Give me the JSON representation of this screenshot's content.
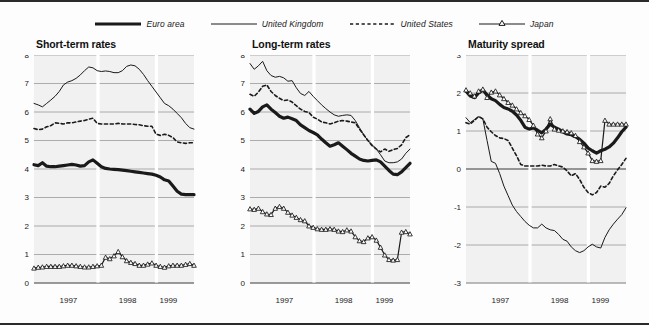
{
  "legend": {
    "items": [
      {
        "label": "Euro area",
        "style": "thick-solid",
        "icon": "line-swatch-icon",
        "color": "#1a1a1a",
        "width": 3.2,
        "dash": "none",
        "marker": "none"
      },
      {
        "label": "United Kingdom",
        "style": "thin-solid",
        "icon": "line-swatch-icon",
        "color": "#1a1a1a",
        "width": 1.0,
        "dash": "none",
        "marker": "none"
      },
      {
        "label": "United States",
        "style": "dashed",
        "icon": "dashed-swatch-icon",
        "color": "#1a1a1a",
        "width": 1.6,
        "dash": "3.2,2.6",
        "marker": "none"
      },
      {
        "label": "Japan",
        "style": "marker-solid",
        "icon": "marker-swatch-icon",
        "color": "#1a1a1a",
        "width": 1.2,
        "dash": "none",
        "marker": "triangle"
      }
    ]
  },
  "axis": {
    "x_tick_labels": [
      "1997",
      "1998",
      "1999"
    ],
    "x_tick_positions": [
      0.215,
      0.585,
      0.84
    ],
    "year_band_positions": [
      0.4,
      0.765
    ],
    "xlabel": "",
    "grid": true
  },
  "chart_data": [
    {
      "type": "line",
      "title": "Short-term rates",
      "xlabel": "",
      "ylabel": "",
      "ylim": [
        0,
        8
      ],
      "yticks": [
        0,
        1,
        2,
        3,
        4,
        5,
        6,
        7,
        8
      ],
      "ytick_labels": [
        "0",
        "1",
        "2",
        "3",
        "4",
        "5",
        "6",
        "7",
        "8"
      ],
      "x": [
        0,
        1,
        2,
        3,
        4,
        5,
        6,
        7,
        8,
        9,
        10,
        11,
        12,
        13,
        14,
        15,
        16,
        17,
        18,
        19,
        20,
        21,
        22,
        23,
        24,
        25,
        26,
        27,
        28,
        29,
        30,
        31,
        32,
        33,
        34,
        35,
        36,
        37,
        38
      ],
      "series": [
        {
          "name": "Euro area",
          "values": [
            4.15,
            4.12,
            4.22,
            4.1,
            4.08,
            4.08,
            4.1,
            4.12,
            4.14,
            4.16,
            4.14,
            4.1,
            4.12,
            4.25,
            4.32,
            4.2,
            4.08,
            4.02,
            4.0,
            3.99,
            3.98,
            3.96,
            3.94,
            3.92,
            3.9,
            3.88,
            3.86,
            3.84,
            3.82,
            3.78,
            3.72,
            3.62,
            3.58,
            3.4,
            3.22,
            3.12,
            3.1,
            3.1,
            3.1
          ]
        },
        {
          "name": "United Kingdom",
          "values": [
            6.3,
            6.25,
            6.18,
            6.3,
            6.42,
            6.55,
            6.72,
            6.95,
            7.05,
            7.1,
            7.18,
            7.3,
            7.45,
            7.58,
            7.55,
            7.45,
            7.42,
            7.44,
            7.42,
            7.38,
            7.38,
            7.45,
            7.6,
            7.65,
            7.62,
            7.5,
            7.32,
            7.1,
            6.9,
            6.7,
            6.5,
            6.3,
            6.22,
            6.1,
            5.95,
            5.8,
            5.6,
            5.45,
            5.4
          ]
        },
        {
          "name": "United States",
          "values": [
            5.42,
            5.38,
            5.4,
            5.48,
            5.52,
            5.62,
            5.6,
            5.58,
            5.62,
            5.62,
            5.65,
            5.68,
            5.7,
            5.75,
            5.78,
            5.6,
            5.58,
            5.58,
            5.58,
            5.58,
            5.6,
            5.58,
            5.58,
            5.58,
            5.56,
            5.55,
            5.52,
            5.5,
            5.5,
            5.22,
            5.18,
            5.22,
            5.18,
            5.1,
            4.95,
            4.92,
            4.9,
            4.92,
            4.92
          ]
        },
        {
          "name": "Japan",
          "values": [
            0.52,
            0.55,
            0.56,
            0.58,
            0.58,
            0.58,
            0.58,
            0.6,
            0.62,
            0.62,
            0.6,
            0.58,
            0.56,
            0.56,
            0.58,
            0.6,
            0.62,
            0.9,
            0.85,
            0.95,
            1.1,
            0.92,
            0.78,
            0.72,
            0.68,
            0.62,
            0.62,
            0.66,
            0.7,
            0.62,
            0.58,
            0.55,
            0.6,
            0.62,
            0.62,
            0.62,
            0.65,
            0.68,
            0.62
          ]
        }
      ]
    },
    {
      "type": "line",
      "title": "Long-term rates",
      "xlabel": "",
      "ylabel": "",
      "ylim": [
        0,
        8
      ],
      "yticks": [
        0,
        1,
        2,
        3,
        4,
        5,
        6,
        7,
        8
      ],
      "ytick_labels": [
        "0",
        "1",
        "2",
        "3",
        "4",
        "5",
        "6",
        "7",
        "8"
      ],
      "x": [
        0,
        1,
        2,
        3,
        4,
        5,
        6,
        7,
        8,
        9,
        10,
        11,
        12,
        13,
        14,
        15,
        16,
        17,
        18,
        19,
        20,
        21,
        22,
        23,
        24,
        25,
        26,
        27,
        28,
        29,
        30,
        31,
        32,
        33,
        34,
        35,
        36,
        37,
        38
      ],
      "series": [
        {
          "name": "Euro area",
          "values": [
            6.1,
            5.95,
            6.02,
            6.18,
            6.25,
            6.1,
            5.98,
            5.85,
            5.78,
            5.82,
            5.76,
            5.7,
            5.55,
            5.45,
            5.35,
            5.28,
            5.2,
            5.05,
            4.92,
            4.8,
            4.85,
            4.92,
            4.8,
            4.68,
            4.55,
            4.45,
            4.35,
            4.3,
            4.28,
            4.3,
            4.32,
            4.25,
            4.1,
            3.95,
            3.82,
            3.8,
            3.9,
            4.05,
            4.2
          ]
        },
        {
          "name": "United Kingdom",
          "values": [
            7.7,
            7.5,
            7.62,
            7.78,
            7.45,
            7.28,
            7.22,
            7.25,
            7.2,
            7.08,
            7.1,
            6.85,
            6.65,
            6.58,
            6.72,
            6.55,
            6.4,
            6.25,
            6.12,
            6.0,
            5.9,
            5.85,
            5.88,
            5.9,
            5.88,
            5.7,
            5.45,
            5.2,
            5.0,
            4.85,
            4.7,
            4.5,
            4.28,
            4.22,
            4.22,
            4.25,
            4.35,
            4.55,
            4.7
          ]
        },
        {
          "name": "United States",
          "values": [
            6.62,
            6.55,
            6.7,
            6.9,
            6.95,
            6.72,
            6.58,
            6.48,
            6.4,
            6.42,
            6.35,
            6.22,
            6.1,
            6.02,
            5.98,
            5.82,
            5.75,
            5.65,
            5.62,
            5.58,
            5.62,
            5.68,
            5.7,
            5.68,
            5.65,
            5.62,
            5.4,
            5.2,
            5.0,
            4.82,
            4.7,
            4.6,
            4.7,
            4.62,
            4.68,
            4.72,
            4.85,
            5.1,
            5.2
          ]
        },
        {
          "name": "Japan",
          "values": [
            2.6,
            2.58,
            2.62,
            2.5,
            2.42,
            2.4,
            2.62,
            2.68,
            2.62,
            2.48,
            2.38,
            2.3,
            2.22,
            2.18,
            2.0,
            1.95,
            1.9,
            1.88,
            1.88,
            1.9,
            1.88,
            1.82,
            1.8,
            1.86,
            1.82,
            1.62,
            1.48,
            1.45,
            1.58,
            1.62,
            1.5,
            1.25,
            0.98,
            0.82,
            0.8,
            0.82,
            1.78,
            1.8,
            1.72
          ]
        }
      ]
    },
    {
      "type": "line",
      "title": "Maturity spread",
      "xlabel": "",
      "ylabel": "",
      "ylim": [
        -3,
        3
      ],
      "yticks": [
        -3,
        -2,
        -1,
        0,
        1,
        2,
        3
      ],
      "ytick_labels": [
        "-3",
        "-2",
        "-1",
        "0",
        "1",
        "2",
        "3"
      ],
      "x": [
        0,
        1,
        2,
        3,
        4,
        5,
        6,
        7,
        8,
        9,
        10,
        11,
        12,
        13,
        14,
        15,
        16,
        17,
        18,
        19,
        20,
        21,
        22,
        23,
        24,
        25,
        26,
        27,
        28,
        29,
        30,
        31,
        32,
        33,
        34,
        35,
        36,
        37,
        38
      ],
      "series": [
        {
          "name": "Euro area",
          "values": [
            2.05,
            1.92,
            1.88,
            2.0,
            2.08,
            1.95,
            1.85,
            1.8,
            1.7,
            1.62,
            1.58,
            1.52,
            1.42,
            1.28,
            1.1,
            1.05,
            1.08,
            1.02,
            0.95,
            1.05,
            1.18,
            1.1,
            1.05,
            0.98,
            0.92,
            0.9,
            0.85,
            0.78,
            0.68,
            0.55,
            0.48,
            0.42,
            0.48,
            0.52,
            0.58,
            0.68,
            0.82,
            0.98,
            1.1
          ]
        },
        {
          "name": "United Kingdom",
          "values": [
            1.35,
            1.22,
            1.3,
            1.38,
            1.32,
            0.75,
            0.2,
            0.15,
            -0.12,
            -0.45,
            -0.7,
            -0.95,
            -1.12,
            -1.25,
            -1.38,
            -1.48,
            -1.55,
            -1.55,
            -1.45,
            -1.55,
            -1.6,
            -1.62,
            -1.72,
            -1.85,
            -1.9,
            -2.05,
            -2.15,
            -2.2,
            -2.15,
            -2.05,
            -1.98,
            -2.05,
            -2.08,
            -1.8,
            -1.6,
            -1.45,
            -1.32,
            -1.2,
            -1.02
          ]
        },
        {
          "name": "United States",
          "values": [
            1.22,
            1.18,
            1.28,
            1.38,
            1.32,
            1.1,
            0.98,
            0.88,
            0.82,
            0.8,
            0.75,
            0.55,
            0.35,
            0.12,
            0.08,
            0.08,
            0.08,
            0.08,
            0.1,
            0.08,
            0.08,
            0.12,
            0.08,
            0.05,
            -0.05,
            -0.18,
            -0.12,
            -0.28,
            -0.48,
            -0.62,
            -0.68,
            -0.62,
            -0.45,
            -0.48,
            -0.38,
            -0.18,
            -0.02,
            0.12,
            0.28
          ]
        },
        {
          "name": "Japan",
          "values": [
            2.08,
            2.0,
            1.92,
            2.05,
            2.1,
            1.88,
            2.02,
            2.05,
            1.95,
            1.85,
            1.75,
            1.68,
            1.58,
            1.48,
            1.4,
            1.3,
            1.15,
            0.92,
            0.82,
            1.0,
            1.32,
            1.05,
            1.02,
            1.0,
            0.98,
            0.95,
            0.88,
            0.72,
            0.58,
            0.42,
            0.22,
            0.2,
            0.22,
            1.28,
            1.18,
            1.18,
            1.18,
            1.18,
            1.18
          ]
        }
      ]
    }
  ]
}
